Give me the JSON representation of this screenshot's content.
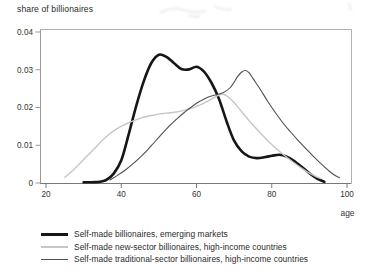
{
  "figure": {
    "background": "#ffffff",
    "frame_color": "#b0b0b0",
    "axis_color": "#787878",
    "left_axis_color": "#9a9a9a",
    "tick_label_color": "#333333",
    "text_color": "#2b2b2b"
  },
  "chart_data": {
    "type": "line",
    "title": "share of billionaires",
    "xlabel": "age",
    "ylabel": "share of billionaires",
    "xlim": [
      20,
      100
    ],
    "ylim": [
      0,
      0.04
    ],
    "grid": false,
    "legend_position": "below-left",
    "x_ticks": [
      {
        "value": 20,
        "label": "20"
      },
      {
        "value": 40,
        "label": "40"
      },
      {
        "value": 60,
        "label": "60"
      },
      {
        "value": 80,
        "label": "80"
      },
      {
        "value": 100,
        "label": "100"
      }
    ],
    "y_ticks": [
      {
        "value": 0,
        "label": "0"
      },
      {
        "value": 0.01,
        "label": "0.01"
      },
      {
        "value": 0.02,
        "label": "0.02"
      },
      {
        "value": 0.03,
        "label": "0.03"
      },
      {
        "value": 0.04,
        "label": "0.04"
      }
    ],
    "series": [
      {
        "name": "Self-made billionaires, emerging markets",
        "color": "#161616",
        "width": 2.6,
        "points": [
          [
            30,
            0.0002
          ],
          [
            32,
            0.0002
          ],
          [
            34,
            0.0003
          ],
          [
            36,
            0.0008
          ],
          [
            38,
            0.0025
          ],
          [
            40,
            0.006
          ],
          [
            42,
            0.013
          ],
          [
            44,
            0.0205
          ],
          [
            46,
            0.027
          ],
          [
            48,
            0.0318
          ],
          [
            50,
            0.034
          ],
          [
            52,
            0.0334
          ],
          [
            54,
            0.0318
          ],
          [
            56,
            0.0302
          ],
          [
            58,
            0.0301
          ],
          [
            60,
            0.0308
          ],
          [
            62,
            0.0295
          ],
          [
            64,
            0.0265
          ],
          [
            66,
            0.0222
          ],
          [
            68,
            0.0163
          ],
          [
            70,
            0.0112
          ],
          [
            72,
            0.0084
          ],
          [
            74,
            0.007
          ],
          [
            76,
            0.0066
          ],
          [
            78,
            0.0068
          ],
          [
            80,
            0.0072
          ],
          [
            82,
            0.0075
          ],
          [
            84,
            0.007
          ],
          [
            86,
            0.0058
          ],
          [
            88,
            0.0042
          ],
          [
            90,
            0.0026
          ],
          [
            92,
            0.0012
          ],
          [
            94,
            0.0003
          ]
        ]
      },
      {
        "name": "Self-made new-sector billionaires, high-income countries",
        "color": "#c6c6c6",
        "width": 1.4,
        "points": [
          [
            25,
            0.0015
          ],
          [
            27,
            0.0032
          ],
          [
            29,
            0.0052
          ],
          [
            31,
            0.0072
          ],
          [
            33,
            0.0092
          ],
          [
            35,
            0.0113
          ],
          [
            37,
            0.0131
          ],
          [
            39,
            0.0145
          ],
          [
            41,
            0.0155
          ],
          [
            43,
            0.0164
          ],
          [
            45,
            0.0171
          ],
          [
            47,
            0.0177
          ],
          [
            49,
            0.0181
          ],
          [
            51,
            0.0184
          ],
          [
            53,
            0.0186
          ],
          [
            55,
            0.0189
          ],
          [
            57,
            0.0193
          ],
          [
            59,
            0.0199
          ],
          [
            61,
            0.0207
          ],
          [
            63,
            0.0217
          ],
          [
            65,
            0.0228
          ],
          [
            66,
            0.0233
          ],
          [
            67,
            0.0235
          ],
          [
            68,
            0.0231
          ],
          [
            70,
            0.0213
          ],
          [
            72,
            0.0189
          ],
          [
            74,
            0.0165
          ],
          [
            76,
            0.0143
          ],
          [
            78,
            0.0122
          ],
          [
            80,
            0.0102
          ],
          [
            82,
            0.0084
          ],
          [
            84,
            0.0068
          ],
          [
            86,
            0.0053
          ],
          [
            88,
            0.0039
          ],
          [
            90,
            0.0026
          ],
          [
            92,
            0.0016
          ],
          [
            93,
            0.0012
          ]
        ]
      },
      {
        "name": "Self-made traditional-sector billionaires, high-income countries",
        "color": "#4f4f4f",
        "width": 1.1,
        "points": [
          [
            37,
            0.0008
          ],
          [
            39,
            0.002
          ],
          [
            41,
            0.0034
          ],
          [
            43,
            0.005
          ],
          [
            45,
            0.0068
          ],
          [
            47,
            0.0088
          ],
          [
            49,
            0.011
          ],
          [
            51,
            0.0132
          ],
          [
            53,
            0.0153
          ],
          [
            55,
            0.0172
          ],
          [
            57,
            0.0189
          ],
          [
            59,
            0.0204
          ],
          [
            61,
            0.0217
          ],
          [
            63,
            0.0227
          ],
          [
            65,
            0.0233
          ],
          [
            67,
            0.0239
          ],
          [
            69,
            0.0253
          ],
          [
            71,
            0.0283
          ],
          [
            72,
            0.0294
          ],
          [
            73,
            0.0298
          ],
          [
            74,
            0.0292
          ],
          [
            75,
            0.0277
          ],
          [
            77,
            0.0247
          ],
          [
            79,
            0.0215
          ],
          [
            81,
            0.0186
          ],
          [
            83,
            0.0159
          ],
          [
            85,
            0.0135
          ],
          [
            87,
            0.0113
          ],
          [
            89,
            0.0092
          ],
          [
            91,
            0.0071
          ],
          [
            93,
            0.0052
          ],
          [
            95,
            0.0034
          ],
          [
            97,
            0.0019
          ],
          [
            98,
            0.0014
          ]
        ]
      }
    ]
  }
}
